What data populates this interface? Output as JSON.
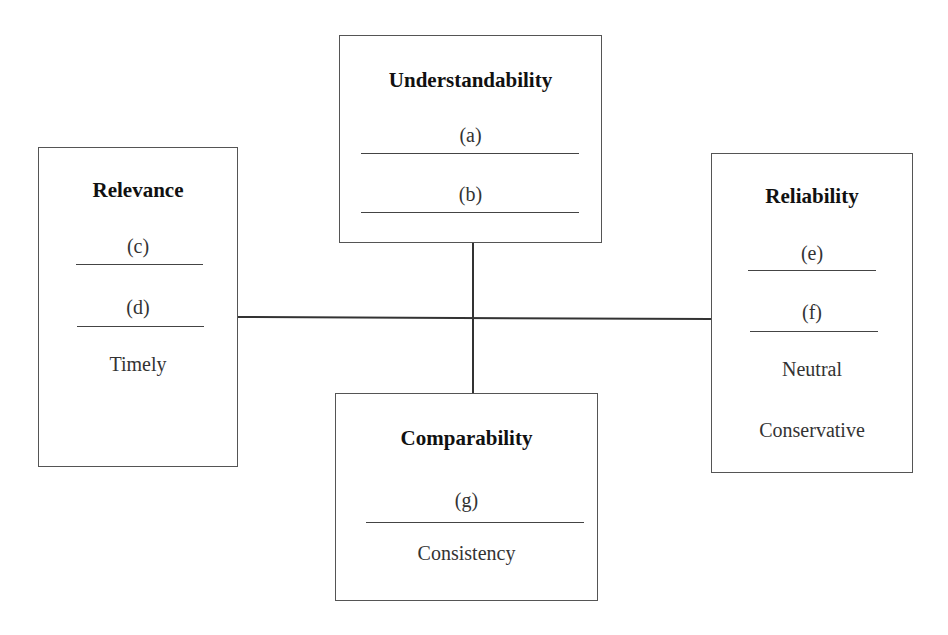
{
  "diagram": {
    "type": "qualitative-characteristics",
    "center_connector": "cross",
    "boxes": {
      "understandability": {
        "title": "Understandability",
        "items": [
          "(a)",
          "(b)"
        ]
      },
      "relevance": {
        "title": "Relevance",
        "items": [
          "(c)",
          "(d)",
          "Timely"
        ]
      },
      "reliability": {
        "title": "Reliability",
        "items": [
          "(e)",
          "(f)",
          "Neutral",
          "Conservative"
        ]
      },
      "comparability": {
        "title": "Comparability",
        "items": [
          "(g)",
          "Consistency"
        ]
      }
    },
    "colors": {
      "border": "#555555",
      "text": "#333333",
      "title": "#111111",
      "background": "#ffffff"
    }
  }
}
